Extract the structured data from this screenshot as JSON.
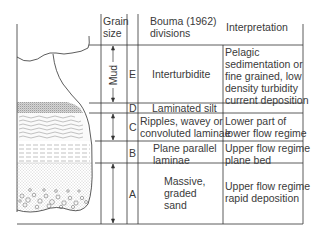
{
  "headers": {
    "grain_size": [
      "Grain",
      "size"
    ],
    "bouma": [
      "Bouma (1962)",
      "divisions"
    ],
    "interpretation": "Interpretation"
  },
  "grain_label": "Mud",
  "divisions": [
    {
      "letter": "E",
      "name": [
        "Interturbidite"
      ],
      "interpretation": [
        "Pelagic",
        "sedimentation or",
        "fine grained, low",
        "density turbidity",
        "current deposition"
      ]
    },
    {
      "letter": "D",
      "name": [
        "Laminated silt"
      ],
      "interpretation": []
    },
    {
      "letter": "C",
      "name": [
        "Ripples, wavey or",
        "convoluted laminae"
      ],
      "interpretation": [
        "Lower part of",
        "lower flow regime"
      ]
    },
    {
      "letter": "B",
      "name": [
        "Plane parallel",
        "laminae"
      ],
      "interpretation": [
        "Upper flow regime",
        "plane bed"
      ]
    },
    {
      "letter": "A",
      "name": [
        "Massive,",
        "graded",
        "sand"
      ],
      "interpretation": [
        "Upper flow regime",
        "rapid deposition"
      ]
    }
  ],
  "colors": {
    "line": "#333333",
    "text": "#3a3a3a",
    "stipple": "#777777"
  }
}
